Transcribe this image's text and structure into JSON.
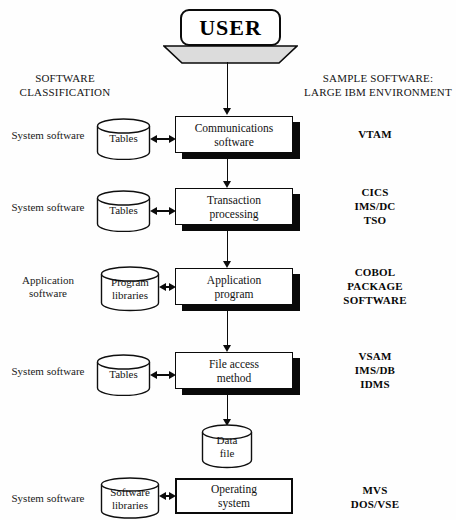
{
  "diagram": {
    "title_left": "SOFTWARE\nCLASSIFICATION",
    "title_left_line1": "SOFTWARE",
    "title_left_line2": "CLASSIFICATION",
    "title_right_line1": "SAMPLE SOFTWARE:",
    "title_right_line2": "LARGE IBM ENVIRONMENT",
    "actor": "USER",
    "ink_color": "#0a0a0a",
    "background_color": "#fefefe"
  },
  "rows": [
    {
      "classification": "System software",
      "store_line1": "Tables",
      "store_line2": "",
      "process_line1": "Communications",
      "process_line2": "software",
      "samples": [
        "VTAM"
      ]
    },
    {
      "classification": "System software",
      "store_line1": "Tables",
      "store_line2": "",
      "process_line1": "Transaction",
      "process_line2": "processing",
      "samples": [
        "CICS",
        "IMS/DC",
        "TSO"
      ]
    },
    {
      "classification": "Application\nsoftware",
      "classification_line1": "Application",
      "classification_line2": "software",
      "store_line1": "Program",
      "store_line2": "libraries",
      "process_line1": "Application",
      "process_line2": "program",
      "samples": [
        "COBOL",
        "PACKAGE",
        "SOFTWARE"
      ]
    },
    {
      "classification": "System software",
      "store_line1": "Tables",
      "store_line2": "",
      "process_line1": "File access",
      "process_line2": "method",
      "samples": [
        "VSAM",
        "IMS/DB",
        "IDMS"
      ]
    },
    {
      "classification": "System software",
      "store_line1": "Software",
      "store_line2": "libraries",
      "process_line1": "Operating",
      "process_line2": "system",
      "samples": [
        "MVS",
        "DOS/VSE"
      ]
    }
  ],
  "data_file": {
    "line1": "Data",
    "line2": "file"
  }
}
